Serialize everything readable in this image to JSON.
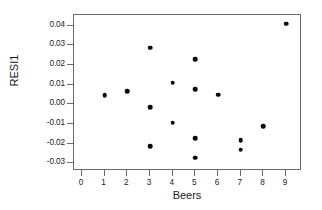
{
  "chart_data": {
    "type": "scatter",
    "title": "",
    "xlabel": "Beers",
    "ylabel": "RESI1",
    "xlim": [
      -0.35,
      9.7
    ],
    "ylim": [
      -0.034,
      0.0455
    ],
    "grid": false,
    "legend": null,
    "xticks": [
      "0",
      "1",
      "2",
      "3",
      "4",
      "5",
      "6",
      "7",
      "8",
      "9"
    ],
    "xtick_values": [
      0,
      1,
      2,
      3,
      4,
      5,
      6,
      7,
      8,
      9
    ],
    "yticks": [
      "0.04",
      "0.03",
      "0.02",
      "0.01",
      "0.00",
      "-0.01",
      "-0.02",
      "-0.03"
    ],
    "ytick_values": [
      0.04,
      0.03,
      0.02,
      0.01,
      0.0,
      -0.01,
      -0.02,
      -0.03
    ],
    "marker": "filled-circle",
    "marker_color": "#0a0a0a",
    "points": [
      {
        "x": 1,
        "y": 0.0047
      },
      {
        "x": 2,
        "y": 0.0068
      },
      {
        "x": 3,
        "y": 0.0289
      },
      {
        "x": 3,
        "y": -0.0015
      },
      {
        "x": 3,
        "y": -0.0215
      },
      {
        "x": 4,
        "y": 0.0111
      },
      {
        "x": 4,
        "y": -0.0093
      },
      {
        "x": 5,
        "y": 0.0229
      },
      {
        "x": 5,
        "y": 0.0078
      },
      {
        "x": 5,
        "y": -0.0173
      },
      {
        "x": 5,
        "y": -0.0273
      },
      {
        "x": 6,
        "y": 0.0049
      },
      {
        "x": 7,
        "y": -0.0184
      },
      {
        "x": 7,
        "y": -0.0232
      },
      {
        "x": 8,
        "y": -0.0111
      },
      {
        "x": 9,
        "y": 0.0411
      }
    ]
  },
  "style": {
    "frame_color": "#6b6b6b",
    "background": "#ffffff",
    "text_color": "#1a1a1a"
  }
}
